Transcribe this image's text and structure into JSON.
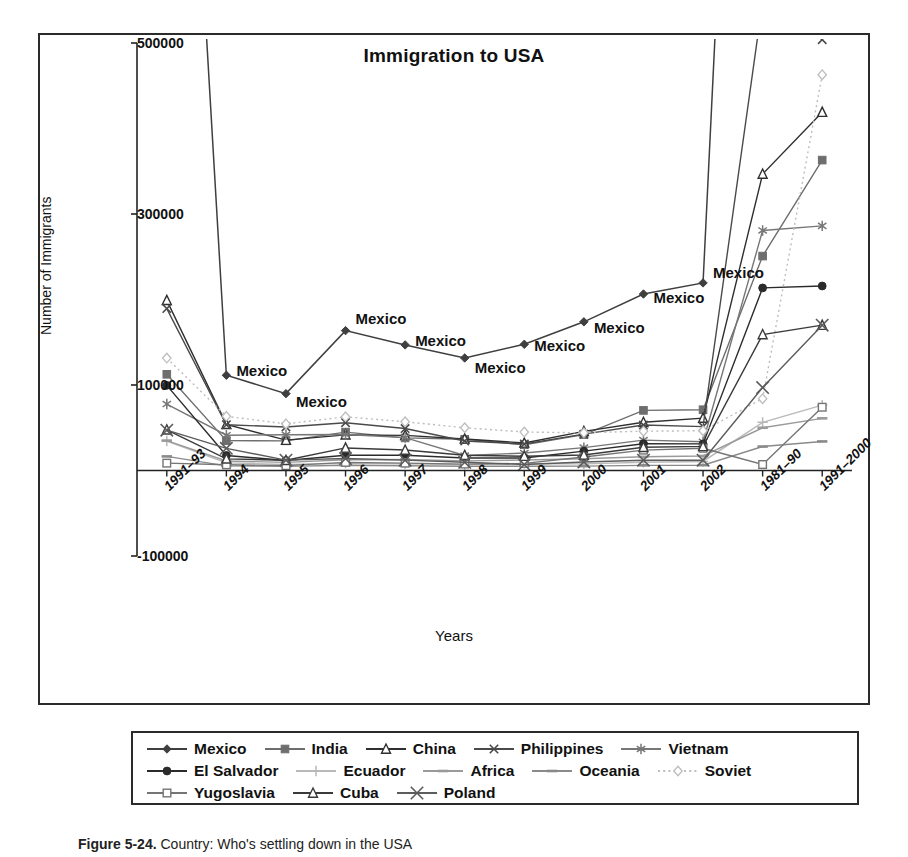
{
  "figure": {
    "caption_label": "Figure 5-24.",
    "caption_text": "Country: Who's settling down in the USA"
  },
  "chart_data": {
    "type": "line",
    "title": "Immigration to USA",
    "xlabel": "Years",
    "ylabel": "Number of Immigrants",
    "ylim": [
      -100000,
      500000
    ],
    "yticks": [
      500000,
      300000,
      100000,
      -100000
    ],
    "ytick_labels": [
      "500000",
      "300000",
      "100000",
      "-100000"
    ],
    "grid": false,
    "legend_position": "bottom",
    "categories": [
      "1991–93",
      "1994",
      "1995",
      "1996",
      "1997",
      "1998",
      "1999",
      "2000",
      "2001",
      "2002",
      "1981–90",
      "1991–2000"
    ],
    "point_label_text": "Mexico",
    "point_label_indices": [
      1,
      2,
      3,
      4,
      5,
      6,
      7,
      8,
      9
    ],
    "series": [
      {
        "name": "Mexico",
        "marker": "diamond-filled",
        "color": "#3f3f3f",
        "dash": "none",
        "values": [
          1300000,
          111400,
          89900,
          163600,
          146900,
          131600,
          147600,
          173900,
          206400,
          219400,
          1653250,
          2249421
        ]
      },
      {
        "name": "India",
        "marker": "square-filled",
        "color": "#6e6e6e",
        "dash": "none",
        "values": [
          112500,
          34900,
          34700,
          44900,
          38100,
          36500,
          30200,
          42000,
          70300,
          71100,
          250786,
          363060
        ]
      },
      {
        "name": "China",
        "marker": "triangle-open",
        "color": "#2f2f2f",
        "dash": "none",
        "values": [
          199000,
          54000,
          35500,
          41700,
          41100,
          36900,
          32200,
          45700,
          56400,
          61300,
          346747,
          419114
        ]
      },
      {
        "name": "Philippines",
        "marker": "x",
        "color": "#4a4a4a",
        "dash": "none",
        "values": [
          189400,
          53500,
          50900,
          55900,
          49100,
          34500,
          31000,
          42500,
          53200,
          51300,
          548764,
          503945
        ]
      },
      {
        "name": "Vietnam",
        "marker": "asterisk",
        "color": "#777777",
        "dash": "none",
        "values": [
          77700,
          41300,
          41800,
          42100,
          38500,
          17600,
          20400,
          26700,
          35500,
          33600,
          280782,
          286145
        ]
      },
      {
        "name": "El Salvador",
        "marker": "circle-filled",
        "color": "#2b2b2b",
        "dash": "none",
        "values": [
          99600,
          17600,
          11700,
          17900,
          17900,
          14600,
          14600,
          22600,
          31300,
          31100,
          213539,
          215798
        ]
      },
      {
        "name": "Ecuador",
        "marker": "plus",
        "color": "#b9b9b9",
        "dash": "none",
        "values": [
          34500,
          8900,
          7100,
          8300,
          7800,
          6900,
          8200,
          7700,
          9700,
          10600,
          56315,
          76461
        ]
      },
      {
        "name": "Africa",
        "marker": "dash",
        "color": "#9a9a9a",
        "dash": "none",
        "values": [
          35000,
          11100,
          9500,
          12500,
          12900,
          11300,
          12300,
          13700,
          16000,
          17000,
          50000,
          61000
        ]
      },
      {
        "name": "Oceania",
        "marker": "dash",
        "color": "#8a8a8a",
        "dash": "none",
        "values": [
          16500,
          5400,
          4800,
          6100,
          5500,
          4900,
          5000,
          5100,
          6000,
          6200,
          28000,
          34000
        ]
      },
      {
        "name": "Soviet",
        "marker": "diamond-open",
        "color": "#bdbdbd",
        "dash": "dotted",
        "values": [
          131500,
          63400,
          54500,
          62800,
          57000,
          50000,
          45000,
          44100,
          46000,
          46500,
          84000,
          462874
        ]
      },
      {
        "name": "Yugoslavia",
        "marker": "square-open",
        "color": "#757575",
        "dash": "none",
        "values": [
          8600,
          6700,
          5700,
          9500,
          8600,
          7500,
          8300,
          15800,
          23800,
          26000,
          7000,
          74000
        ]
      },
      {
        "name": "Cuba",
        "marker": "triangle-open",
        "color": "#3a3a3a",
        "dash": "none",
        "values": [
          47600,
          13600,
          12000,
          26400,
          24000,
          17800,
          16700,
          18100,
          27200,
          28200,
          159000,
          170000
        ]
      },
      {
        "name": "Poland",
        "marker": "x-large",
        "color": "#5c5c5c",
        "dash": "none",
        "values": [
          47200,
          25900,
          12100,
          14000,
          12100,
          9600,
          7000,
          10000,
          12000,
          12000,
          97000,
          170000
        ]
      }
    ]
  },
  "legend": {
    "rows": [
      [
        {
          "label": "Mexico",
          "marker": "diamond-filled",
          "color": "#3f3f3f",
          "dash": "none"
        },
        {
          "label": "India",
          "marker": "square-filled",
          "color": "#6e6e6e",
          "dash": "none"
        },
        {
          "label": "China",
          "marker": "triangle-open",
          "color": "#2f2f2f",
          "dash": "none"
        },
        {
          "label": "Philippines",
          "marker": "x",
          "color": "#4a4a4a",
          "dash": "none"
        },
        {
          "label": "Vietnam",
          "marker": "asterisk",
          "color": "#777777",
          "dash": "none"
        }
      ],
      [
        {
          "label": "El Salvador",
          "marker": "circle-filled",
          "color": "#2b2b2b",
          "dash": "none"
        },
        {
          "label": "Ecuador",
          "marker": "plus",
          "color": "#b9b9b9",
          "dash": "none"
        },
        {
          "label": "Africa",
          "marker": "dash",
          "color": "#9a9a9a",
          "dash": "none"
        },
        {
          "label": "Oceania",
          "marker": "dash",
          "color": "#8a8a8a",
          "dash": "none"
        },
        {
          "label": "Soviet",
          "marker": "diamond-open",
          "color": "#bdbdbd",
          "dash": "dotted"
        }
      ],
      [
        {
          "label": "Yugoslavia",
          "marker": "square-open",
          "color": "#757575",
          "dash": "none"
        },
        {
          "label": "Cuba",
          "marker": "triangle-open",
          "color": "#3a3a3a",
          "dash": "none"
        },
        {
          "label": "Poland",
          "marker": "x-large",
          "color": "#5c5c5c",
          "dash": "none"
        }
      ]
    ]
  }
}
